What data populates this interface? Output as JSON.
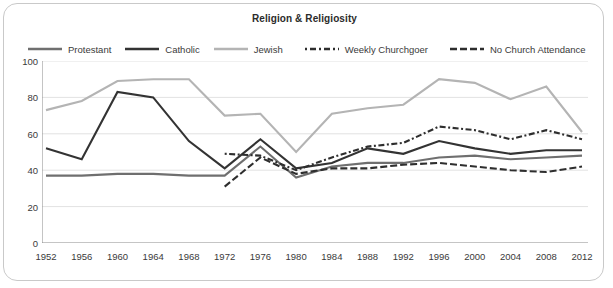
{
  "chart_data": {
    "type": "line",
    "title": "Religion & Religiosity",
    "xlabel": "",
    "ylabel": "",
    "ylim": [
      0,
      100
    ],
    "yticks": [
      0,
      20,
      40,
      60,
      80,
      100
    ],
    "grid": true,
    "legend_position": "top",
    "categories": [
      1952,
      1956,
      1960,
      1964,
      1968,
      1972,
      1976,
      1980,
      1984,
      1988,
      1992,
      1996,
      2000,
      2004,
      2008,
      2012
    ],
    "x": [
      "1952",
      "1956",
      "1960",
      "1964",
      "1968",
      "1972",
      "1976",
      "1980",
      "1984",
      "1988",
      "1992",
      "1996",
      "2000",
      "2004",
      "2008",
      "2012"
    ],
    "series": [
      {
        "name": "Protestant",
        "color": "#6f6f6f",
        "style": "solid",
        "width": 2.1,
        "x": [
          1952,
          1956,
          1960,
          1964,
          1968,
          1972,
          1976,
          1980,
          1984,
          1988,
          1992,
          1996,
          2000,
          2004,
          2008,
          2012
        ],
        "values": [
          37,
          37,
          38,
          38,
          37,
          37,
          53,
          36,
          42,
          44,
          44,
          47,
          48,
          46,
          47,
          48
        ]
      },
      {
        "name": "Catholic",
        "color": "#333333",
        "style": "solid",
        "width": 2.1,
        "x": [
          1952,
          1956,
          1960,
          1964,
          1968,
          1972,
          1976,
          1980,
          1984,
          1988,
          1992,
          1996,
          2000,
          2004,
          2008,
          2012
        ],
        "values": [
          52,
          46,
          83,
          80,
          56,
          41,
          57,
          41,
          44,
          52,
          49,
          56,
          52,
          49,
          51,
          51
        ]
      },
      {
        "name": "Jewish",
        "color": "#b4b4b4",
        "style": "solid",
        "width": 2.1,
        "x": [
          1952,
          1956,
          1960,
          1964,
          1968,
          1972,
          1976,
          1980,
          1984,
          1988,
          1992,
          1996,
          2000,
          2004,
          2008,
          2012
        ],
        "values": [
          73,
          78,
          89,
          90,
          90,
          70,
          71,
          50,
          71,
          74,
          76,
          90,
          88,
          79,
          86,
          61
        ]
      },
      {
        "name": "Weekly Churchgoer",
        "color": "#2e2e2e",
        "style": "dashed",
        "width": 2.1,
        "x": [
          1972,
          1976,
          1980,
          1984,
          1988,
          1992,
          1996,
          2000,
          2004,
          2008,
          2012
        ],
        "values": [
          49,
          48,
          40,
          47,
          53,
          55,
          64,
          62,
          57,
          62,
          57
        ]
      },
      {
        "name": "No Church Attendance",
        "color": "#2e2e2e",
        "style": "dashed-long",
        "width": 2.1,
        "x": [
          1972,
          1976,
          1980,
          1984,
          1988,
          1992,
          1996,
          2000,
          2004,
          2008,
          2012
        ],
        "values": [
          31,
          47,
          38,
          41,
          41,
          43,
          44,
          42,
          40,
          39,
          42
        ]
      }
    ]
  }
}
